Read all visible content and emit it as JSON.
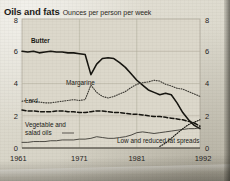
{
  "header": {
    "title": "Oils and fats",
    "subtitle": "Ounces per person per week"
  },
  "axes": {
    "y_left_ticks": [
      "8",
      "6",
      "4",
      "2",
      "0"
    ],
    "y_right_ticks": [
      "8",
      "6",
      "4",
      "2",
      "0"
    ],
    "x_ticks": [
      "1961",
      "1971",
      "1981",
      "1992"
    ]
  },
  "series_labels": {
    "butter": "Butter",
    "margarine": "Margarine",
    "lard": "Lard",
    "vegetable_oils": "Vegetable and\nsalad oils",
    "vegetable_oils_line1": "Vegetable and",
    "vegetable_oils_line2": "salad oils",
    "low_fat": "Low and reduced fat spreads"
  },
  "colors": {
    "ink": "#1b1a16",
    "paper": "#ddd9cd",
    "grid": "#b7b2a2",
    "butter": "#15140f",
    "margarine": "#3b3933",
    "lard": "#15140f",
    "vegetable": "#3b3933",
    "lowfat": "#15140f"
  },
  "chart_data": {
    "type": "line",
    "title": "Oils and fats",
    "subtitle": "Ounces per person per week",
    "xlabel": "",
    "ylabel": "Ounces per person per week",
    "xlim": [
      1961,
      1992
    ],
    "ylim": [
      0,
      8
    ],
    "grid": true,
    "legend": "inline-annotations",
    "x": [
      1961,
      1962,
      1963,
      1964,
      1965,
      1966,
      1967,
      1968,
      1969,
      1970,
      1971,
      1972,
      1973,
      1974,
      1975,
      1976,
      1977,
      1978,
      1979,
      1980,
      1981,
      1982,
      1983,
      1984,
      1985,
      1986,
      1987,
      1988,
      1989,
      1990,
      1991,
      1992
    ],
    "series": [
      {
        "name": "Butter",
        "style": "solid",
        "values": [
          6.0,
          5.95,
          6.0,
          5.9,
          5.95,
          6.0,
          5.95,
          5.95,
          5.9,
          5.9,
          5.85,
          5.8,
          4.55,
          5.2,
          5.55,
          5.6,
          5.55,
          5.3,
          5.0,
          4.6,
          4.2,
          3.9,
          3.6,
          3.45,
          3.3,
          3.4,
          3.3,
          2.8,
          2.2,
          1.75,
          1.4,
          1.2
        ]
      },
      {
        "name": "Margarine",
        "style": "dotted",
        "values": [
          2.9,
          2.95,
          2.9,
          2.85,
          2.8,
          2.8,
          2.85,
          2.9,
          2.95,
          3.0,
          2.95,
          3.0,
          3.9,
          3.45,
          3.2,
          3.1,
          3.2,
          3.35,
          3.5,
          3.75,
          3.95,
          4.05,
          4.1,
          4.2,
          4.15,
          3.95,
          3.85,
          3.7,
          3.65,
          3.5,
          3.35,
          3.2
        ]
      },
      {
        "name": "Lard",
        "style": "dashed",
        "values": [
          2.35,
          2.3,
          2.3,
          2.25,
          2.25,
          2.25,
          2.3,
          2.3,
          2.25,
          2.25,
          2.2,
          2.2,
          2.25,
          2.3,
          2.3,
          2.25,
          2.2,
          2.2,
          2.15,
          2.1,
          2.1,
          2.05,
          2.0,
          1.95,
          1.95,
          1.9,
          1.85,
          1.8,
          1.75,
          1.65,
          1.55,
          1.35
        ]
      },
      {
        "name": "Vegetable and salad oils",
        "style": "thin-solid",
        "values": [
          0.35,
          0.35,
          0.4,
          0.4,
          0.4,
          0.45,
          0.45,
          0.5,
          0.5,
          0.5,
          0.55,
          0.55,
          0.6,
          0.7,
          0.65,
          0.6,
          0.6,
          0.65,
          0.7,
          0.8,
          0.95,
          1.0,
          0.95,
          0.9,
          0.95,
          1.0,
          1.05,
          1.1,
          1.15,
          1.2,
          1.2,
          1.25
        ]
      },
      {
        "name": "Low and reduced fat spreads",
        "style": "dotted-short",
        "values": [
          null,
          null,
          null,
          null,
          null,
          null,
          null,
          null,
          null,
          null,
          null,
          null,
          null,
          null,
          null,
          null,
          null,
          null,
          null,
          null,
          null,
          null,
          null,
          null,
          0.1,
          0.3,
          0.6,
          0.9,
          1.2,
          1.45,
          1.6,
          1.75
        ]
      }
    ]
  }
}
